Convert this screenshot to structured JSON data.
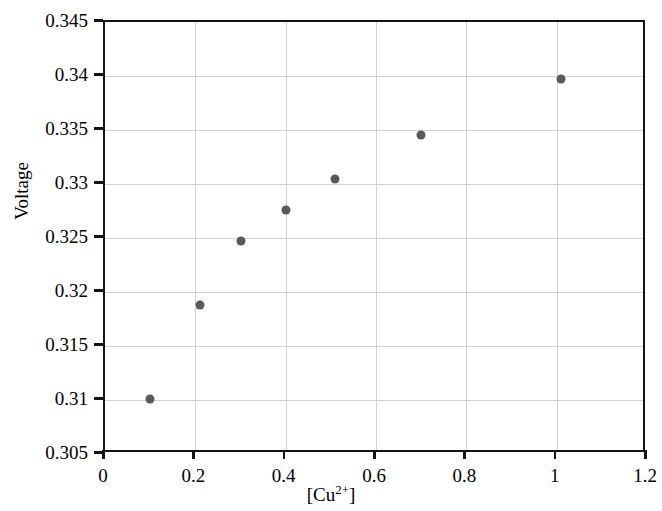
{
  "chart_data": {
    "type": "scatter",
    "title": "",
    "xlabel": "[Cu2+]",
    "xlabel_base": "[Cu",
    "xlabel_sup": "2+",
    "xlabel_close": "]",
    "ylabel": "Voltage",
    "xlim": [
      0,
      1.2
    ],
    "ylim": [
      0.305,
      0.345
    ],
    "xticks": [
      "0",
      "0.2",
      "0.4",
      "0.6",
      "0.8",
      "1",
      "1.2"
    ],
    "xtick_values": [
      0,
      0.2,
      0.4,
      0.6,
      0.8,
      1.0,
      1.2
    ],
    "yticks": [
      "0.305",
      "0.31",
      "0.315",
      "0.32",
      "0.325",
      "0.33",
      "0.335",
      "0.34",
      "0.345"
    ],
    "ytick_values": [
      0.305,
      0.31,
      0.315,
      0.32,
      0.325,
      0.33,
      0.335,
      0.34,
      0.345
    ],
    "grid": true,
    "legend": "none",
    "marker_color": "#595959",
    "axis_color": "#141414",
    "grid_color": "#d2d2d2",
    "series": [
      {
        "name": "Voltage vs [Cu2+]",
        "x": [
          0.1,
          0.21,
          0.3,
          0.4,
          0.51,
          0.7,
          1.01
        ],
        "y": [
          0.3101,
          0.3188,
          0.3247,
          0.3276,
          0.3305,
          0.3345,
          0.3397
        ]
      }
    ]
  }
}
